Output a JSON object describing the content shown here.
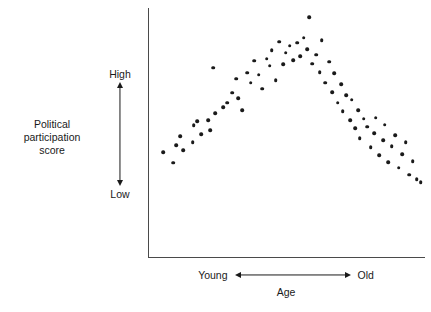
{
  "chart_data": {
    "type": "scatter",
    "title": "",
    "xlabel": "Age",
    "ylabel": "Political participation score",
    "grid": false,
    "legend": null,
    "x_axis": {
      "label": "Age",
      "low_end_label": "Young",
      "high_end_label": "Old",
      "direction_arrow": "double-headed",
      "ticks": [],
      "xlim": [
        0,
        100
      ]
    },
    "y_axis": {
      "label_line1": "Political participation",
      "label_line2": "score",
      "low_label": "Low",
      "high_label": "High",
      "direction_arrow": "double-headed",
      "ticks": [],
      "ylim": [
        0,
        100
      ]
    },
    "relationship": "inverted-U (curvilinear): participation rises from young to middle age, then declines into old age",
    "n_points": 74,
    "points": [
      {
        "x": 5.1,
        "y": 42.2
      },
      {
        "x": 8.7,
        "y": 37.8
      },
      {
        "x": 9.8,
        "y": 45.0
      },
      {
        "x": 11.2,
        "y": 48.6
      },
      {
        "x": 12.4,
        "y": 43.0
      },
      {
        "x": 15.8,
        "y": 46.2
      },
      {
        "x": 16.2,
        "y": 53.0
      },
      {
        "x": 19.0,
        "y": 49.4
      },
      {
        "x": 17.5,
        "y": 54.6
      },
      {
        "x": 21.4,
        "y": 55.0
      },
      {
        "x": 22.1,
        "y": 51.0
      },
      {
        "x": 24.0,
        "y": 57.8
      },
      {
        "x": 23.2,
        "y": 76.0
      },
      {
        "x": 26.8,
        "y": 60.2
      },
      {
        "x": 28.3,
        "y": 62.0
      },
      {
        "x": 30.1,
        "y": 66.0
      },
      {
        "x": 31.5,
        "y": 71.6
      },
      {
        "x": 32.4,
        "y": 63.8
      },
      {
        "x": 33.8,
        "y": 59.0
      },
      {
        "x": 35.6,
        "y": 74.0
      },
      {
        "x": 36.9,
        "y": 70.0
      },
      {
        "x": 38.2,
        "y": 78.8
      },
      {
        "x": 39.8,
        "y": 73.2
      },
      {
        "x": 41.0,
        "y": 67.6
      },
      {
        "x": 42.6,
        "y": 79.6
      },
      {
        "x": 43.8,
        "y": 76.8
      },
      {
        "x": 44.4,
        "y": 83.0
      },
      {
        "x": 45.9,
        "y": 71.0
      },
      {
        "x": 47.2,
        "y": 86.4
      },
      {
        "x": 48.6,
        "y": 77.4
      },
      {
        "x": 49.5,
        "y": 82.0
      },
      {
        "x": 51.0,
        "y": 84.8
      },
      {
        "x": 52.3,
        "y": 79.0
      },
      {
        "x": 53.6,
        "y": 86.0
      },
      {
        "x": 54.8,
        "y": 80.6
      },
      {
        "x": 56.1,
        "y": 88.0
      },
      {
        "x": 57.4,
        "y": 83.4
      },
      {
        "x": 58.0,
        "y": 96.4
      },
      {
        "x": 59.2,
        "y": 77.6
      },
      {
        "x": 60.5,
        "y": 81.2
      },
      {
        "x": 61.8,
        "y": 74.2
      },
      {
        "x": 62.5,
        "y": 87.0
      },
      {
        "x": 63.9,
        "y": 70.0
      },
      {
        "x": 65.2,
        "y": 78.4
      },
      {
        "x": 66.4,
        "y": 66.2
      },
      {
        "x": 67.0,
        "y": 73.8
      },
      {
        "x": 68.3,
        "y": 62.0
      },
      {
        "x": 69.6,
        "y": 69.4
      },
      {
        "x": 70.2,
        "y": 58.6
      },
      {
        "x": 71.5,
        "y": 65.0
      },
      {
        "x": 72.8,
        "y": 55.0
      },
      {
        "x": 73.4,
        "y": 63.2
      },
      {
        "x": 74.7,
        "y": 51.8
      },
      {
        "x": 75.9,
        "y": 59.0
      },
      {
        "x": 76.4,
        "y": 47.6
      },
      {
        "x": 77.8,
        "y": 55.6
      },
      {
        "x": 79.1,
        "y": 52.4
      },
      {
        "x": 80.3,
        "y": 44.0
      },
      {
        "x": 81.6,
        "y": 49.8
      },
      {
        "x": 82.2,
        "y": 56.0
      },
      {
        "x": 83.5,
        "y": 41.0
      },
      {
        "x": 84.8,
        "y": 47.0
      },
      {
        "x": 85.4,
        "y": 53.2
      },
      {
        "x": 86.7,
        "y": 38.0
      },
      {
        "x": 88.0,
        "y": 44.6
      },
      {
        "x": 89.2,
        "y": 49.0
      },
      {
        "x": 90.5,
        "y": 35.8
      },
      {
        "x": 91.8,
        "y": 41.2
      },
      {
        "x": 93.0,
        "y": 46.0
      },
      {
        "x": 94.3,
        "y": 33.0
      },
      {
        "x": 95.6,
        "y": 38.4
      },
      {
        "x": 97.0,
        "y": 31.2
      },
      {
        "x": 98.4,
        "y": 30.0
      }
    ]
  },
  "colors": {
    "point": "#1a1a1a",
    "axis": "#4a4a4a",
    "text": "#1a1a1a",
    "background": "#ffffff"
  }
}
